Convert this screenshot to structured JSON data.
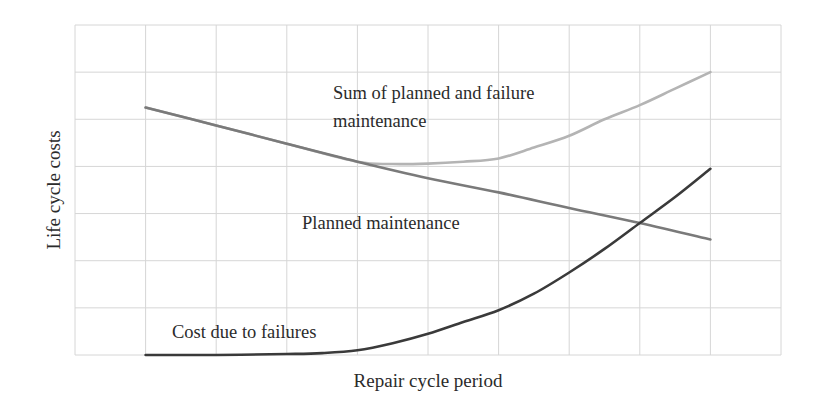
{
  "chart_data": {
    "type": "line",
    "title": "",
    "xlabel": "Repair cycle period",
    "ylabel": "Life cycle costs",
    "grid": true,
    "grid_columns": 10,
    "grid_rows": 7,
    "xlim": [
      0,
      10
    ],
    "ylim": [
      0,
      7
    ],
    "tick_labels_shown": false,
    "legend": "inline annotations",
    "series": [
      {
        "name": "Sum of planned and failure maintenance",
        "label_lines": [
          "Sum of planned and failure",
          "maintenance"
        ],
        "color": "#b4b4b4",
        "x": [
          1,
          2,
          3,
          4,
          4.5,
          5,
          5.5,
          6,
          6.5,
          7,
          7.5,
          8,
          8.5,
          9
        ],
        "y": [
          5.25,
          4.87,
          4.48,
          4.1,
          4.05,
          4.06,
          4.1,
          4.17,
          4.4,
          4.65,
          5.0,
          5.3,
          5.65,
          6.0
        ]
      },
      {
        "name": "Planned maintenance",
        "label_lines": [
          "Planned maintenance"
        ],
        "color": "#7a7a7a",
        "x": [
          1,
          2,
          3,
          4,
          5,
          6,
          7,
          8,
          9
        ],
        "y": [
          5.25,
          4.87,
          4.48,
          4.1,
          3.75,
          3.45,
          3.12,
          2.8,
          2.45
        ]
      },
      {
        "name": "Cost due to failures",
        "label_lines": [
          "Cost due to failures"
        ],
        "color": "#3a3a3a",
        "x": [
          1,
          2,
          3,
          3.5,
          4,
          4.5,
          5,
          5.5,
          6,
          6.5,
          7,
          7.5,
          8,
          8.5,
          9
        ],
        "y": [
          0,
          0,
          0.02,
          0.04,
          0.1,
          0.25,
          0.45,
          0.7,
          0.95,
          1.3,
          1.75,
          2.25,
          2.8,
          3.35,
          3.95
        ]
      }
    ]
  }
}
